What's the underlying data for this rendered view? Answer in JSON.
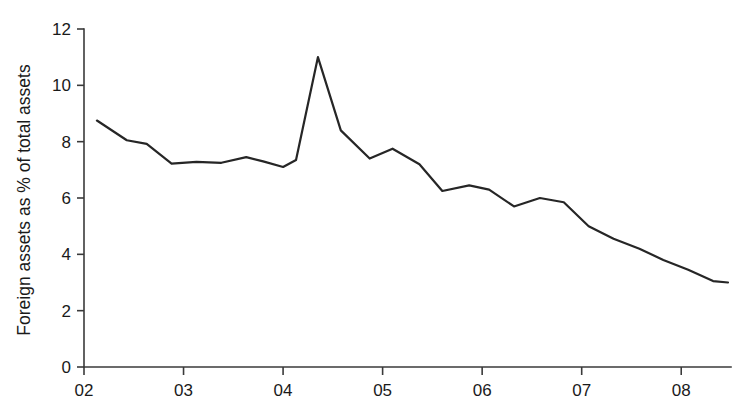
{
  "chart_data": {
    "type": "line",
    "title": "",
    "xlabel": "",
    "ylabel": "Foreign assets as % of total assets",
    "xlim": [
      2002.0,
      2008.5
    ],
    "ylim": [
      0,
      12
    ],
    "grid": false,
    "legend": null,
    "y_ticks": [
      0,
      2,
      4,
      6,
      8,
      10,
      12
    ],
    "y_tick_labels": [
      "0",
      "2",
      "4",
      "6",
      "8",
      "10",
      "12"
    ],
    "x_ticks": [
      2002,
      2003,
      2004,
      2005,
      2006,
      2007,
      2008
    ],
    "x_tick_labels": [
      "02",
      "03",
      "04",
      "05",
      "06",
      "07",
      "08"
    ],
    "series": [
      {
        "name": "Foreign assets as % of total assets",
        "color": "#262626",
        "x": [
          2002.13,
          2002.43,
          2002.63,
          2002.88,
          2003.13,
          2003.38,
          2003.63,
          2003.8,
          2004.0,
          2004.13,
          2004.35,
          2004.58,
          2004.87,
          2005.1,
          2005.37,
          2005.6,
          2005.87,
          2006.07,
          2006.32,
          2006.58,
          2006.82,
          2007.07,
          2007.32,
          2007.58,
          2007.82,
          2008.07,
          2008.32,
          2008.47
        ],
        "y": [
          8.75,
          8.05,
          7.92,
          7.22,
          7.28,
          7.25,
          7.45,
          7.3,
          7.1,
          7.35,
          11.0,
          8.4,
          7.4,
          7.75,
          7.2,
          6.25,
          6.45,
          6.3,
          5.7,
          6.0,
          5.85,
          5.0,
          4.55,
          4.2,
          3.8,
          3.45,
          3.05,
          3.0
        ]
      }
    ]
  },
  "plot_geometry": {
    "origin_x_px": 84,
    "origin_y_px": 367,
    "axis_top_y_px": 29,
    "axis_right_x_px": 731,
    "px_per_year": 100,
    "px_per_unit": 28.17
  }
}
